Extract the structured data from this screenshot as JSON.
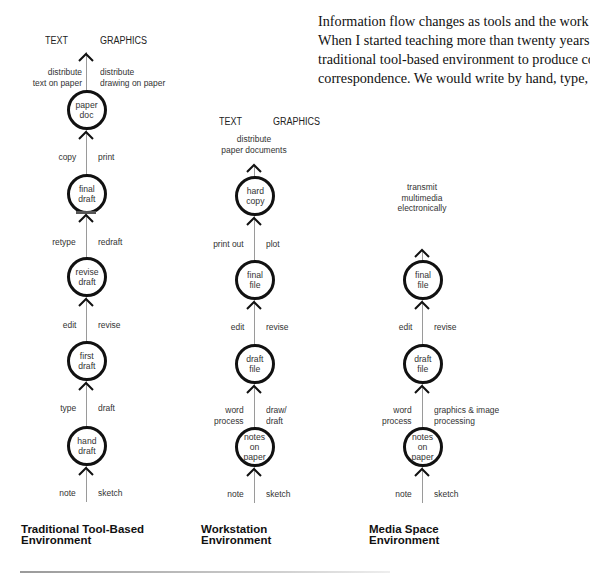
{
  "paragraph": {
    "lines": [
      "Information flow changes as tools and the work environment change.",
      "When I started teaching more than twenty years ago, we worked in a",
      "traditional tool-based environment to produce course materials and",
      "correspondence. We would write by hand, type, edit, retype, copy, and"
    ]
  },
  "diagrams": {
    "traditional": {
      "header_text": "TEXT",
      "header_graphics": "GRAPHICS",
      "top_left": [
        "distribute",
        "text on paper"
      ],
      "top_right": [
        "distribute",
        "drawing on paper"
      ],
      "nodes": [
        [
          "paper",
          "doc"
        ],
        [
          "final",
          "draft"
        ],
        [
          "revise",
          "draft"
        ],
        [
          "first",
          "draft"
        ],
        [
          "hand",
          "draft"
        ]
      ],
      "steps": [
        {
          "left": "copy",
          "right": "print"
        },
        {
          "left": "retype",
          "right": "redraft"
        },
        {
          "left": "edit",
          "right": "revise"
        },
        {
          "left": "type",
          "right": "draft"
        },
        {
          "left": "note",
          "right": "sketch"
        }
      ],
      "title": [
        "Traditional Tool-Based",
        "Environment"
      ]
    },
    "workstation": {
      "header_text": "TEXT",
      "header_graphics": "GRAPHICS",
      "top_center": [
        "distribute",
        "paper documents"
      ],
      "nodes": [
        [
          "hard",
          "copy"
        ],
        [
          "final",
          "file"
        ],
        [
          "draft",
          "file"
        ],
        [
          "notes",
          "on",
          "paper"
        ]
      ],
      "steps": [
        {
          "left": [
            "print out"
          ],
          "right": [
            "plot"
          ]
        },
        {
          "left": [
            "edit"
          ],
          "right": [
            "revise"
          ]
        },
        {
          "left": [
            "word",
            "process"
          ],
          "right": [
            "draw/",
            "draft"
          ]
        },
        {
          "left": [
            "note"
          ],
          "right": [
            "sketch"
          ]
        }
      ],
      "title": [
        "Workstation",
        "Environment"
      ]
    },
    "media_space": {
      "top_center": [
        "transmit",
        "multimedia",
        "electronically"
      ],
      "nodes": [
        [
          "final",
          "file"
        ],
        [
          "draft",
          "file"
        ],
        [
          "notes",
          "on",
          "paper"
        ]
      ],
      "steps": [
        {
          "left": [
            "edit"
          ],
          "right": [
            "revise"
          ]
        },
        {
          "left": [
            "word",
            "process"
          ],
          "right": [
            "graphics & image",
            "processing"
          ]
        },
        {
          "left": [
            "note"
          ],
          "right": [
            "sketch"
          ]
        }
      ],
      "title": [
        "Media Space",
        "Environment"
      ]
    }
  },
  "colors": {
    "ink": "#111111",
    "label": "#333333",
    "line": "#9a9a9a"
  }
}
